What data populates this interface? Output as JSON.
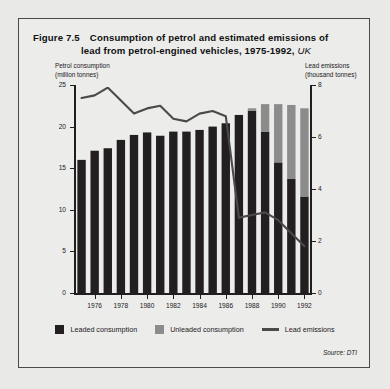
{
  "figure": {
    "number": "Figure 7.5",
    "title_line1": "Consumption of petrol and estimated emissions of",
    "title_line2": "lead from petrol-engined vehicles, 1975-1992,",
    "region": "UK",
    "source": "Source: DTI"
  },
  "legend": {
    "items": [
      {
        "label": "Leaded consumption",
        "marker": "square-swatch",
        "color": "#231f20"
      },
      {
        "label": "Unleaded consumption",
        "marker": "square-swatch",
        "color": "#8c8c8c"
      },
      {
        "label": "Lead emissions",
        "marker": "line-swatch",
        "color": "#4a4a4a"
      }
    ]
  },
  "chart_data": {
    "type": "bar",
    "title": "Consumption of petrol and estimated emissions of lead from petrol-engined vehicles, 1975-1992, UK",
    "subtitle": "",
    "xlabel": "",
    "ylabel": "Petrol consumption (million tonnes)",
    "y2label": "Lead emissions (thousand tonnes)",
    "left_axis_caption_line1": "Petrol consumption",
    "left_axis_caption_line2": "(million tonnes)",
    "right_axis_caption_line1": "Lead emissions",
    "right_axis_caption_line2": "(thousand tonnes)",
    "grid": false,
    "legend_position": "bottom",
    "stacked": true,
    "categories": [
      1975,
      1976,
      1977,
      1978,
      1979,
      1980,
      1981,
      1982,
      1983,
      1984,
      1985,
      1986,
      1987,
      1988,
      1989,
      1990,
      1991,
      1992
    ],
    "tick_labels_x": [
      "1976",
      "1978",
      "1980",
      "1982",
      "1984",
      "1986",
      "1988",
      "1990",
      "1992"
    ],
    "ylim": [
      0,
      25
    ],
    "yticks": [
      0,
      5,
      10,
      15,
      20,
      25
    ],
    "y2lim": [
      0,
      8
    ],
    "y2ticks": [
      0,
      2,
      4,
      6,
      8
    ],
    "series": [
      {
        "name": "Leaded consumption",
        "type": "bar",
        "axis": "left",
        "color": "#231f20",
        "values": [
          16.0,
          17.1,
          17.4,
          18.4,
          19.0,
          19.3,
          18.9,
          19.4,
          19.4,
          19.6,
          20.0,
          20.4,
          21.4,
          21.9,
          19.4,
          15.7,
          13.7,
          11.6
        ]
      },
      {
        "name": "Unleaded consumption",
        "type": "bar",
        "axis": "left",
        "color": "#8c8c8c",
        "values": [
          0,
          0,
          0,
          0,
          0,
          0,
          0,
          0,
          0,
          0,
          0,
          0,
          0,
          0.3,
          3.3,
          7.0,
          8.9,
          10.6
        ]
      },
      {
        "name": "Lead emissions",
        "type": "line",
        "axis": "right",
        "color": "#4a4a4a",
        "values": [
          7.5,
          7.6,
          7.9,
          7.4,
          6.9,
          7.1,
          7.2,
          6.7,
          6.6,
          6.9,
          7.0,
          6.8,
          2.9,
          3.0,
          3.1,
          2.8,
          2.3,
          1.8
        ]
      }
    ]
  }
}
